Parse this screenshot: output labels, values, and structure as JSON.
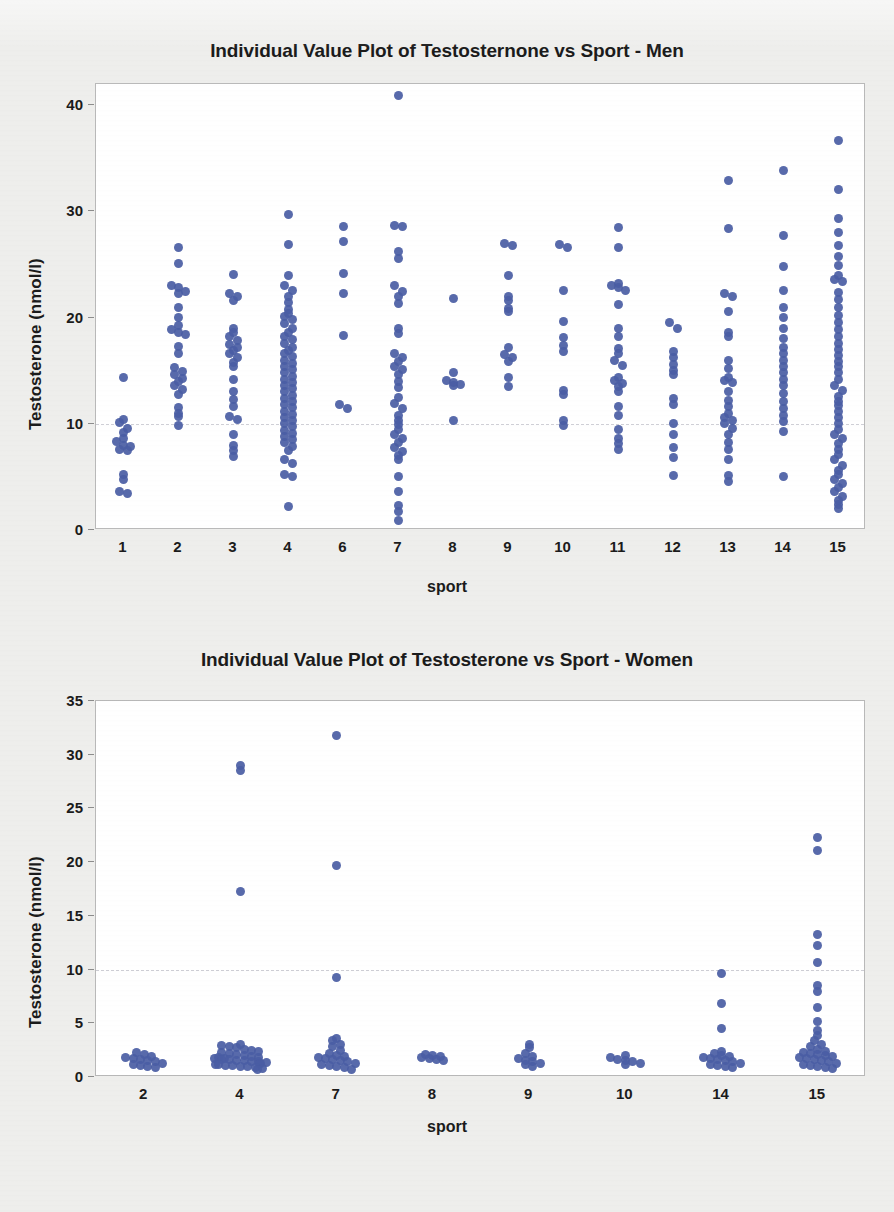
{
  "page": {
    "background": "#eeeeec",
    "dot_color": "#4a5da4",
    "axis_color": "#1b1b1b",
    "grid_color": "#cfcfd6"
  },
  "figures": [
    {
      "key": "men",
      "title": "Individual Value Plot of Testosternone vs Sport - Men",
      "xlabel": "sport",
      "ylabel": "Testosterone (nmol/l)"
    },
    {
      "key": "women",
      "title": "Individual Value Plot of Testosterone vs Sport - Women",
      "xlabel": "sport",
      "ylabel": "Testosterone (nmol/l)"
    }
  ],
  "chart_data": [
    {
      "id": "men",
      "type": "scatter",
      "plot_style": "individual-value-plot",
      "title": "Individual Value Plot of Testosternone vs Sport - Men",
      "xlabel": "sport",
      "ylabel": "Testosterone (nmol/l)",
      "categories": [
        "1",
        "2",
        "3",
        "4",
        "6",
        "7",
        "8",
        "9",
        "10",
        "11",
        "12",
        "13",
        "14",
        "15"
      ],
      "ylim": [
        0,
        42
      ],
      "yticks": [
        0,
        10,
        20,
        30,
        40
      ],
      "gridlines": [
        10
      ],
      "grid": "horizontal-dashed-at-10",
      "legend": "none",
      "groups": [
        {
          "category": "1",
          "values": [
            14.4,
            10.4,
            10.1,
            9.6,
            9.2,
            8.6,
            8.3,
            8.0,
            7.9,
            7.6,
            7.5,
            5.2,
            4.8,
            3.6,
            3.4
          ]
        },
        {
          "category": "2",
          "values": [
            26.6,
            25.1,
            23.0,
            22.8,
            22.5,
            22.3,
            21.0,
            20.0,
            19.3,
            18.9,
            18.6,
            18.4,
            17.3,
            16.6,
            15.3,
            14.9,
            14.6,
            14.3,
            14.0,
            13.6,
            13.2,
            12.8,
            11.5,
            11.0,
            10.7,
            9.8
          ]
        },
        {
          "category": "3",
          "values": [
            24.1,
            22.3,
            22.0,
            21.6,
            19.0,
            18.6,
            18.2,
            17.8,
            17.5,
            17.2,
            16.9,
            16.6,
            16.2,
            15.8,
            15.4,
            14.2,
            13.0,
            12.3,
            11.6,
            10.7,
            10.4,
            9.0,
            8.0,
            7.5,
            6.9
          ]
        },
        {
          "category": "4",
          "values": [
            29.7,
            26.9,
            24.0,
            23.0,
            22.6,
            22.0,
            21.4,
            20.8,
            20.4,
            20.1,
            19.8,
            19.4,
            19.0,
            18.6,
            18.2,
            17.9,
            17.6,
            17.2,
            16.9,
            16.6,
            16.3,
            16.0,
            15.7,
            15.4,
            15.1,
            14.8,
            14.5,
            14.2,
            13.9,
            13.6,
            13.3,
            13.0,
            12.7,
            12.4,
            12.1,
            11.8,
            11.5,
            11.2,
            10.9,
            10.6,
            10.3,
            10.0,
            9.7,
            9.4,
            9.1,
            8.8,
            8.5,
            8.2,
            7.9,
            7.5,
            6.6,
            6.3,
            5.2,
            5.0,
            2.2
          ]
        },
        {
          "category": "6",
          "values": [
            28.6,
            27.2,
            24.2,
            22.3,
            18.3,
            11.8,
            11.4
          ]
        },
        {
          "category": "7",
          "values": [
            40.9,
            28.7,
            28.6,
            26.2,
            25.6,
            23.0,
            22.5,
            22.0,
            21.3,
            19.0,
            18.5,
            16.6,
            16.2,
            15.9,
            15.4,
            15.1,
            14.6,
            14.0,
            13.4,
            12.5,
            11.9,
            11.4,
            10.8,
            10.3,
            9.9,
            9.5,
            9.0,
            8.6,
            8.2,
            7.8,
            7.4,
            7.0,
            6.6,
            5.0,
            3.6,
            2.3,
            1.7,
            0.9
          ]
        },
        {
          "category": "8",
          "values": [
            21.8,
            14.8,
            14.1,
            13.9,
            13.7,
            13.6,
            10.3
          ]
        },
        {
          "category": "9",
          "values": [
            27.0,
            26.8,
            24.0,
            22.0,
            21.6,
            20.9,
            20.6,
            17.2,
            16.5,
            16.2,
            15.9,
            14.4,
            13.5
          ]
        },
        {
          "category": "10",
          "values": [
            26.9,
            26.6,
            22.6,
            19.6,
            18.1,
            17.4,
            16.8,
            13.1,
            12.8,
            10.3,
            9.8
          ]
        },
        {
          "category": "11",
          "values": [
            28.5,
            26.6,
            23.2,
            23.0,
            22.8,
            22.6,
            21.2,
            19.0,
            18.2,
            17.1,
            16.6,
            16.0,
            15.5,
            14.4,
            14.1,
            13.8,
            13.5,
            13.0,
            11.6,
            10.8,
            9.5,
            8.6,
            8.1,
            7.6
          ]
        },
        {
          "category": "12",
          "values": [
            19.5,
            19.0,
            16.8,
            16.2,
            15.6,
            15.0,
            14.6,
            12.4,
            11.8,
            10.0,
            9.0,
            7.8,
            6.8,
            5.1
          ]
        },
        {
          "category": "13",
          "values": [
            32.9,
            28.4,
            22.3,
            22.0,
            20.6,
            18.6,
            18.2,
            16.0,
            15.2,
            14.4,
            14.1,
            13.9,
            13.0,
            12.2,
            11.6,
            11.0,
            10.6,
            10.3,
            10.0,
            9.6,
            9.0,
            8.2,
            7.6,
            6.6,
            5.1,
            4.6
          ]
        },
        {
          "category": "14",
          "values": [
            33.9,
            27.7,
            24.8,
            22.6,
            21.0,
            20.0,
            19.0,
            18.0,
            17.2,
            16.6,
            16.0,
            15.4,
            14.8,
            14.2,
            13.6,
            12.9,
            12.1,
            11.4,
            10.8,
            10.2,
            9.3,
            5.0
          ]
        },
        {
          "category": "15",
          "values": [
            36.7,
            32.1,
            29.3,
            28.0,
            26.8,
            25.8,
            24.9,
            24.0,
            23.6,
            23.4,
            22.4,
            21.7,
            21.0,
            20.2,
            19.5,
            18.9,
            18.2,
            17.6,
            17.0,
            16.4,
            15.9,
            15.4,
            14.8,
            14.2,
            13.6,
            13.1,
            12.6,
            12.1,
            11.7,
            11.2,
            10.6,
            10.0,
            9.5,
            9.0,
            8.6,
            8.1,
            7.6,
            7.1,
            6.6,
            6.1,
            5.6,
            5.2,
            4.8,
            4.4,
            4.0,
            3.6,
            3.2,
            2.8,
            2.4,
            2.0
          ]
        }
      ]
    },
    {
      "id": "women",
      "type": "scatter",
      "plot_style": "individual-value-plot",
      "title": "Individual Value Plot of Testosterone vs Sport - Women",
      "xlabel": "sport",
      "ylabel": "Testosterone (nmol/l)",
      "categories": [
        "2",
        "4",
        "7",
        "8",
        "9",
        "10",
        "14",
        "15"
      ],
      "ylim": [
        0,
        35
      ],
      "yticks": [
        0,
        5,
        10,
        15,
        20,
        25,
        30,
        35
      ],
      "gridlines": [
        10
      ],
      "grid": "horizontal-dashed-at-10",
      "legend": "none",
      "groups": [
        {
          "category": "2",
          "values": [
            2.3,
            2.1,
            1.9,
            1.8,
            1.7,
            1.6,
            1.5,
            1.4,
            1.3,
            1.2,
            1.1,
            1.0,
            0.9
          ]
        },
        {
          "category": "4",
          "values": [
            29.0,
            28.5,
            17.3,
            3.0,
            2.9,
            2.8,
            2.7,
            2.6,
            2.5,
            2.4,
            2.3,
            2.2,
            2.1,
            2.0,
            1.9,
            1.85,
            1.8,
            1.75,
            1.7,
            1.65,
            1.6,
            1.55,
            1.5,
            1.45,
            1.4,
            1.35,
            1.3,
            1.25,
            1.2,
            1.15,
            1.1,
            1.05,
            1.0,
            0.95,
            0.9,
            0.8,
            0.7
          ]
        },
        {
          "category": "7",
          "values": [
            31.8,
            19.7,
            9.3,
            3.6,
            3.4,
            3.0,
            2.8,
            2.5,
            2.2,
            2.0,
            1.9,
            1.8,
            1.7,
            1.6,
            1.5,
            1.4,
            1.3,
            1.2,
            1.1,
            1.0,
            0.9,
            0.7
          ]
        },
        {
          "category": "8",
          "values": [
            2.1,
            2.0,
            1.9,
            1.8,
            1.7,
            1.6,
            1.5
          ]
        },
        {
          "category": "9",
          "values": [
            3.0,
            2.7,
            2.2,
            1.9,
            1.7,
            1.5,
            1.4,
            1.3,
            1.2,
            1.0
          ]
        },
        {
          "category": "10",
          "values": [
            2.0,
            1.8,
            1.6,
            1.5,
            1.4,
            1.3,
            1.2
          ]
        },
        {
          "category": "14",
          "values": [
            9.6,
            6.8,
            4.5,
            2.4,
            2.2,
            2.0,
            1.9,
            1.8,
            1.7,
            1.6,
            1.5,
            1.4,
            1.3,
            1.2,
            1.1,
            1.0,
            0.9
          ]
        },
        {
          "category": "15",
          "values": [
            22.3,
            21.1,
            13.3,
            12.2,
            10.7,
            8.5,
            8.0,
            6.5,
            5.2,
            4.3,
            3.9,
            3.4,
            3.0,
            2.8,
            2.6,
            2.4,
            2.3,
            2.2,
            2.1,
            2.0,
            1.9,
            1.8,
            1.7,
            1.6,
            1.5,
            1.4,
            1.3,
            1.2,
            1.1,
            1.0,
            0.9,
            0.8
          ]
        }
      ]
    }
  ]
}
